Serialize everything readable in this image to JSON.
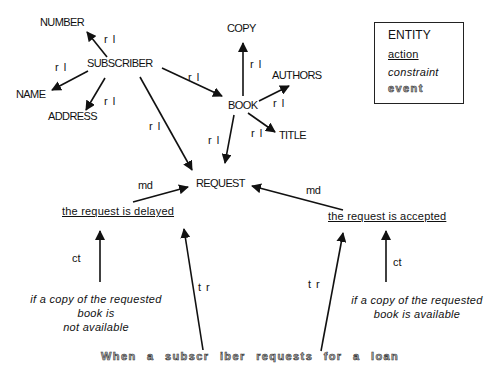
{
  "legend": {
    "entity": "ENTITY",
    "action": "action",
    "constraint": "constraint",
    "event": "event"
  },
  "entities": {
    "number": "NUMBER",
    "subscriber": "SUBSCRIBER",
    "name": "NAME",
    "address": "ADDRESS",
    "copy": "COPY",
    "book": "BOOK",
    "authors": "AUTHORS",
    "title": "TITLE",
    "request": "REQUEST"
  },
  "relations": {
    "rl": "r l",
    "md": "md",
    "ct": "ct",
    "tr": "t r"
  },
  "actions": {
    "delayed": "the request is delayed",
    "accepted": "the request is accepted"
  },
  "constraints": {
    "not_available_line1": "if a copy of the requested",
    "not_available_line2": "book is",
    "not_available_line3": "not available",
    "available_line1": "if a copy of the requested",
    "available_line2": "book is available"
  },
  "event": {
    "text": "When a subscr iber requests for a loan"
  }
}
